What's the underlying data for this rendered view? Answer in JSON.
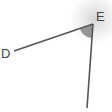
{
  "diagram": {
    "type": "angle",
    "points": {
      "D": {
        "label": "D"
      },
      "E": {
        "label": "E",
        "role": "vertex"
      }
    },
    "rays": [
      {
        "from": "E",
        "to": "D"
      },
      {
        "from": "E",
        "direction": "down"
      }
    ],
    "angle_marker": {
      "vertex": "E",
      "style": "shaded-sector"
    },
    "colors": {
      "line": "#555555",
      "angle_fill": "#8a8a8a",
      "label": "#444444",
      "glow": "#c8c8c8"
    }
  }
}
